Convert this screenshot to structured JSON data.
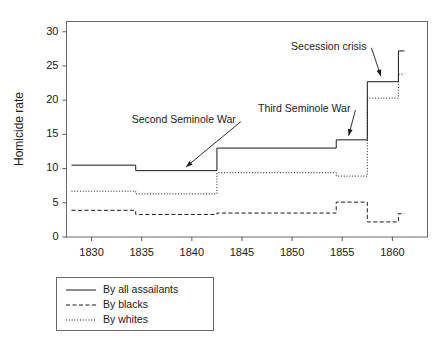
{
  "chart_data": {
    "type": "line",
    "title": "",
    "xlabel": "",
    "ylabel": "Homicide rate",
    "xlim": [
      1827.5,
      1863.5
    ],
    "ylim": [
      0,
      31.5
    ],
    "grid": false,
    "step_style": "post",
    "x_ticks": [
      1830,
      1835,
      1840,
      1845,
      1850,
      1855,
      1860
    ],
    "x_tick_labels": [
      "1830",
      "1835",
      "1840",
      "1845",
      "1850",
      "1855",
      "1860"
    ],
    "y_ticks": [
      0,
      5,
      10,
      15,
      20,
      25,
      30
    ],
    "y_tick_labels": [
      "0",
      "5",
      "10",
      "15",
      "20",
      "25",
      "30"
    ],
    "legend_position": "below-left",
    "series": [
      {
        "name": "By all assailants",
        "style": "solid",
        "x": [
          1828.0,
          1834.4,
          1842.5,
          1854.4,
          1857.5,
          1860.6
        ],
        "values": [
          10.5,
          9.7,
          13.0,
          14.2,
          22.7,
          27.2
        ],
        "x_end": 1861.2
      },
      {
        "name": "By blacks",
        "style": "dashed",
        "x": [
          1828.0,
          1834.4,
          1842.5,
          1854.4,
          1857.5,
          1860.6
        ],
        "values": [
          3.9,
          3.3,
          3.5,
          5.1,
          2.2,
          3.4
        ],
        "x_end": 1861.2
      },
      {
        "name": "By whites",
        "style": "dotted",
        "x": [
          1828.0,
          1834.4,
          1842.5,
          1854.4,
          1857.5,
          1860.6
        ],
        "values": [
          6.7,
          6.3,
          9.4,
          8.9,
          20.3,
          23.8
        ],
        "x_end": 1861.2
      }
    ],
    "annotations": [
      {
        "text": "Second Seminole War",
        "text_x": 1834.0,
        "text_y": 17.0,
        "point_x": 1839.3,
        "point_y": 10.1
      },
      {
        "text": "Third Seminole War",
        "text_x": 1846.6,
        "text_y": 18.7,
        "point_x": 1855.6,
        "point_y": 14.6
      },
      {
        "text": "Secession crisis",
        "text_x": 1849.9,
        "text_y": 27.8,
        "point_x": 1858.9,
        "point_y": 23.3
      }
    ]
  },
  "legend": {
    "entries": [
      {
        "label": "By all assailants",
        "style": "solid"
      },
      {
        "label": "By blacks",
        "style": "dashed"
      },
      {
        "label": "By whites",
        "style": "dotted"
      }
    ]
  }
}
